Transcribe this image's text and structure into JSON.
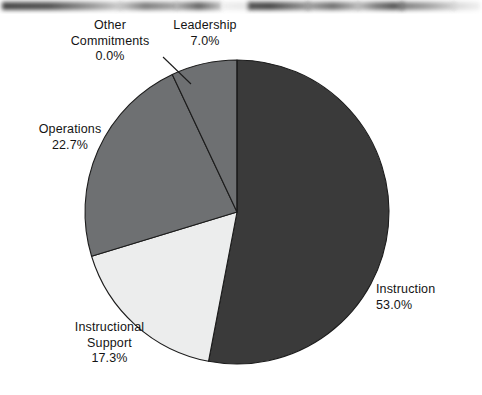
{
  "chart_data": {
    "type": "pie",
    "title": "",
    "subtitle": "",
    "xlabel": "",
    "ylabel": "",
    "legend_position": "none",
    "grid": false,
    "value_unit": "percent",
    "start_angle_deg": 0,
    "direction": "clockwise",
    "categories": [
      "Instruction",
      "Instructional Support",
      "Operations",
      "Leadership",
      "Other Commitments"
    ],
    "values": [
      53.0,
      17.3,
      22.7,
      7.0,
      0.0
    ],
    "value_labels": [
      "53.0%",
      "17.3%",
      "22.7%",
      "7.0%",
      "0.0%"
    ],
    "colors": [
      "#3a3a3a",
      "#eceded",
      "#6e7072",
      "#6e7072",
      "#6e7072"
    ],
    "slices": [
      {
        "name": "Instruction",
        "value": 53.0,
        "value_label": "53.0%",
        "color": "#3a3a3a",
        "label_position": "right"
      },
      {
        "name": "Instructional Support",
        "value": 17.3,
        "value_label": "17.3%",
        "color": "#eceded",
        "label_position": "bottom-left"
      },
      {
        "name": "Operations",
        "value": 22.7,
        "value_label": "22.7%",
        "color": "#6e7072",
        "label_position": "left"
      },
      {
        "name": "Leadership",
        "value": 7.0,
        "value_label": "7.0%",
        "color": "#6e7072",
        "label_position": "top"
      },
      {
        "name": "Other Commitments",
        "value": 0.0,
        "value_label": "0.0%",
        "color": "#6e7072",
        "label_position": "top-left",
        "has_leader_line": true
      }
    ]
  },
  "labels": {
    "leadership": {
      "name": "Leadership",
      "value": "7.0%"
    },
    "other_commitments": {
      "name_line1": "Other",
      "name_line2": "Commitments",
      "value": "0.0%"
    },
    "operations": {
      "name": "Operations",
      "value": "22.7%"
    },
    "instruction": {
      "name": "Instruction",
      "value": "53.0%"
    },
    "instructional_support": {
      "name_line1": "Instructional",
      "name_line2": "Support",
      "value": "17.3%"
    }
  },
  "style": {
    "background": "#ffffff",
    "outline": "#1c1c1c",
    "leader_line": "#1c1c1c"
  }
}
